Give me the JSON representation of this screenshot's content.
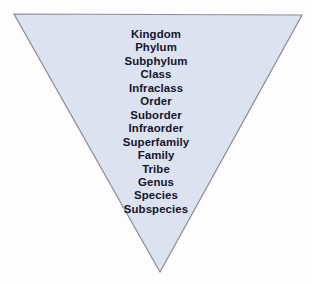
{
  "diagram": {
    "shape_name": "inverted-triangle",
    "fill_color": "#dde2f0",
    "border_color": "#8b8b9c",
    "background_color": "#fdfdfd",
    "text_color": "#12152b",
    "ranks": [
      "Kingdom",
      "Phylum",
      "Subphylum",
      "Class",
      "Infraclass",
      "Order",
      "Suborder",
      "Infraorder",
      "Superfamily",
      "Family",
      "Tribe",
      "Genus",
      "Species",
      "Subspecies"
    ]
  }
}
